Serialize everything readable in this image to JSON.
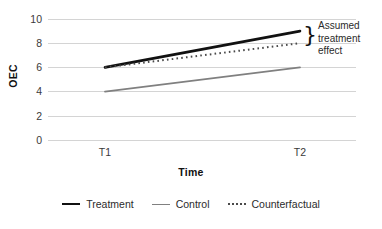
{
  "chart_data": {
    "type": "line",
    "title": "",
    "xlabel": "Time",
    "ylabel": "OEC",
    "categories": [
      "T1",
      "T2"
    ],
    "x": [
      0,
      1
    ],
    "xtick_labels": [
      "T1",
      "T2"
    ],
    "ytick_labels": [
      "0",
      "2",
      "4",
      "6",
      "8",
      "10"
    ],
    "yticks": [
      0,
      2,
      4,
      6,
      8,
      10
    ],
    "ylim": [
      0,
      10
    ],
    "grid": true,
    "grid_axis": "y",
    "legend_position": "bottom",
    "series": [
      {
        "name": "Treatment",
        "values": [
          6,
          9
        ],
        "style": "solid",
        "color": "#111111",
        "width": 2.6
      },
      {
        "name": "Control",
        "values": [
          4,
          6
        ],
        "style": "solid",
        "color": "#808080",
        "width": 1.8
      },
      {
        "name": "Counterfactual",
        "values": [
          6,
          8
        ],
        "style": "dotted",
        "color": "#4a4a4a",
        "width": 2
      }
    ],
    "annotations": [
      {
        "name": "assumed-treatment-effect",
        "lines": [
          "Assumed",
          "treatment",
          "effect"
        ],
        "brace": "}",
        "spans_values": [
          8,
          9
        ],
        "at_category": "T2"
      }
    ]
  },
  "legend": {
    "items": [
      {
        "label": "Treatment",
        "swatch": "solid-thick-line-icon"
      },
      {
        "label": "Control",
        "swatch": "solid-thin-line-icon"
      },
      {
        "label": "Counterfactual",
        "swatch": "dotted-line-icon"
      }
    ]
  },
  "annotation": {
    "brace": "}",
    "line1": "Assumed",
    "line2": "treatment",
    "line3": "effect"
  },
  "axes": {
    "y_title": "OEC",
    "x_title": "Time",
    "y_labels": [
      "10",
      "8",
      "6",
      "4",
      "2",
      "0"
    ],
    "x_labels": [
      "T1",
      "T2"
    ]
  },
  "colors": {
    "treatment": "#111111",
    "control": "#808080",
    "counterfactual": "#4a4a4a",
    "gridline": "#d4d4d4",
    "text": "#2b2b2b",
    "background": "#ffffff"
  }
}
